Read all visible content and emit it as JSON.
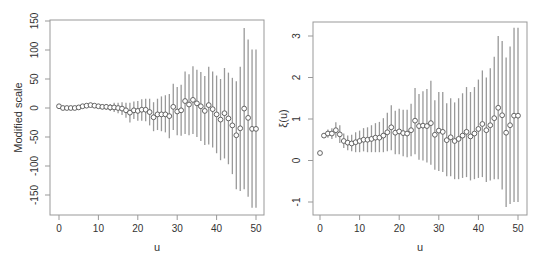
{
  "chart_data": [
    {
      "type": "scatter",
      "subtype": "point-with-error-bars",
      "title": "",
      "xlabel": "u",
      "ylabel": "Modified scale",
      "xlim": [
        0,
        50
      ],
      "ylim": [
        -175,
        150
      ],
      "xticks": [
        0,
        10,
        20,
        30,
        40,
        50
      ],
      "xtick_labels": [
        "0",
        "10",
        "20",
        "30",
        "40",
        "50"
      ],
      "yticks": [
        -150,
        -100,
        -50,
        0,
        50,
        100,
        150
      ],
      "ytick_labels": [
        "-150",
        "-100",
        "-50",
        "0",
        "50",
        "100",
        "150"
      ],
      "grid": false,
      "legend": null,
      "x": [
        0,
        1,
        2,
        3,
        4,
        5,
        6,
        7,
        8,
        9,
        10,
        11,
        12,
        13,
        14,
        15,
        16,
        17,
        18,
        19,
        20,
        21,
        22,
        23,
        24,
        25,
        26,
        27,
        28,
        29,
        30,
        31,
        32,
        33,
        34,
        35,
        36,
        37,
        38,
        39,
        40,
        41,
        42,
        43,
        44,
        45,
        46,
        47,
        48,
        49,
        50
      ],
      "series": [
        {
          "name": "estimate",
          "values": [
            3,
            0,
            0,
            0,
            0,
            1,
            3,
            4,
            5,
            4,
            3,
            2,
            2,
            1,
            1,
            0,
            -1,
            -4,
            -8,
            -4,
            -5,
            -3,
            -3,
            -7,
            -16,
            -11,
            -11,
            -11,
            -14,
            2,
            -6,
            -4,
            12,
            6,
            14,
            8,
            3,
            -5,
            5,
            -2,
            -11,
            -20,
            -9,
            -18,
            -30,
            -47,
            -35,
            -1,
            -17,
            -36,
            -36
          ],
          "lower": [
            3,
            0,
            0,
            0,
            -1,
            0,
            2,
            2,
            2,
            1,
            0,
            -2,
            -3,
            -5,
            -7,
            -9,
            -12,
            -17,
            -25,
            -19,
            -22,
            -22,
            -23,
            -30,
            -40,
            -38,
            -40,
            -42,
            -52,
            -38,
            -47,
            -48,
            -45,
            -47,
            -45,
            -50,
            -57,
            -64,
            -63,
            -68,
            -78,
            -90,
            -87,
            -97,
            -114,
            -140,
            -143,
            -140,
            -153,
            -172,
            -172
          ],
          "upper": [
            3,
            0,
            0,
            0,
            1,
            2,
            4,
            6,
            8,
            7,
            6,
            6,
            7,
            7,
            9,
            9,
            10,
            9,
            9,
            11,
            12,
            15,
            16,
            16,
            10,
            16,
            20,
            22,
            24,
            42,
            36,
            40,
            63,
            58,
            72,
            66,
            62,
            55,
            71,
            63,
            56,
            50,
            69,
            61,
            52,
            46,
            71,
            138,
            118,
            101,
            101
          ]
        }
      ]
    },
    {
      "type": "scatter",
      "subtype": "point-with-error-bars",
      "title": "",
      "xlabel": "u",
      "ylabel": "ξ(u)",
      "xlim": [
        0,
        50
      ],
      "ylim": [
        -1.3,
        3.4
      ],
      "xticks": [
        0,
        10,
        20,
        30,
        40,
        50
      ],
      "xtick_labels": [
        "0",
        "10",
        "20",
        "30",
        "40",
        "50"
      ],
      "yticks": [
        -1,
        0,
        1,
        2,
        3
      ],
      "ytick_labels": [
        "-1",
        "0",
        "1",
        "2",
        "3"
      ],
      "grid": false,
      "legend": null,
      "x": [
        0,
        1,
        2,
        3,
        4,
        5,
        6,
        7,
        8,
        9,
        10,
        11,
        12,
        13,
        14,
        15,
        16,
        17,
        18,
        19,
        20,
        21,
        22,
        23,
        24,
        25,
        26,
        27,
        28,
        29,
        30,
        31,
        32,
        33,
        34,
        35,
        36,
        37,
        38,
        39,
        40,
        41,
        42,
        43,
        44,
        45,
        46,
        47,
        48,
        49,
        50
      ],
      "series": [
        {
          "name": "estimate",
          "values": [
            0.18,
            0.6,
            0.65,
            0.65,
            0.73,
            0.63,
            0.47,
            0.43,
            0.41,
            0.44,
            0.47,
            0.5,
            0.5,
            0.52,
            0.55,
            0.55,
            0.6,
            0.68,
            0.8,
            0.67,
            0.7,
            0.66,
            0.65,
            0.73,
            0.96,
            0.83,
            0.84,
            0.83,
            0.9,
            0.62,
            0.72,
            0.69,
            0.49,
            0.56,
            0.47,
            0.52,
            0.6,
            0.69,
            0.58,
            0.65,
            0.76,
            0.88,
            0.73,
            0.85,
            1.02,
            1.27,
            1.09,
            0.67,
            0.85,
            1.08,
            1.08
          ],
          "lower": [
            0.18,
            0.55,
            0.55,
            0.52,
            0.55,
            0.42,
            0.3,
            0.25,
            0.22,
            0.2,
            0.2,
            0.22,
            0.2,
            0.2,
            0.2,
            0.2,
            0.2,
            0.22,
            0.25,
            0.15,
            0.15,
            0.1,
            0.08,
            0.1,
            0.15,
            0.02,
            0.0,
            -0.05,
            -0.1,
            -0.22,
            -0.25,
            -0.28,
            -0.38,
            -0.38,
            -0.45,
            -0.45,
            -0.42,
            -0.4,
            -0.48,
            -0.45,
            -0.42,
            -0.4,
            -0.52,
            -0.48,
            -0.45,
            -0.45,
            -0.7,
            -1.12,
            -1.05,
            -1.0,
            -1.0
          ],
          "upper": [
            0.18,
            0.65,
            0.75,
            0.78,
            0.92,
            0.85,
            0.65,
            0.6,
            0.62,
            0.68,
            0.72,
            0.78,
            0.8,
            0.85,
            0.9,
            0.93,
            1.02,
            1.15,
            1.33,
            1.2,
            1.25,
            1.22,
            1.22,
            1.37,
            1.75,
            1.6,
            1.67,
            1.72,
            1.92,
            1.45,
            1.65,
            1.65,
            1.38,
            1.5,
            1.4,
            1.5,
            1.62,
            1.77,
            1.65,
            1.77,
            1.95,
            2.17,
            2.0,
            2.22,
            2.5,
            3.0,
            2.88,
            2.48,
            2.75,
            3.2,
            3.2
          ]
        }
      ]
    }
  ],
  "panels": {
    "left": {
      "xlabel": "u",
      "ylabel": "Modified scale"
    },
    "right": {
      "xlabel": "u",
      "ylabel": "ξ(u)"
    }
  },
  "style": {
    "point_stroke": "#555555",
    "bar_color": "#999999",
    "frame_color": "#999999",
    "text_color": "#333333"
  }
}
